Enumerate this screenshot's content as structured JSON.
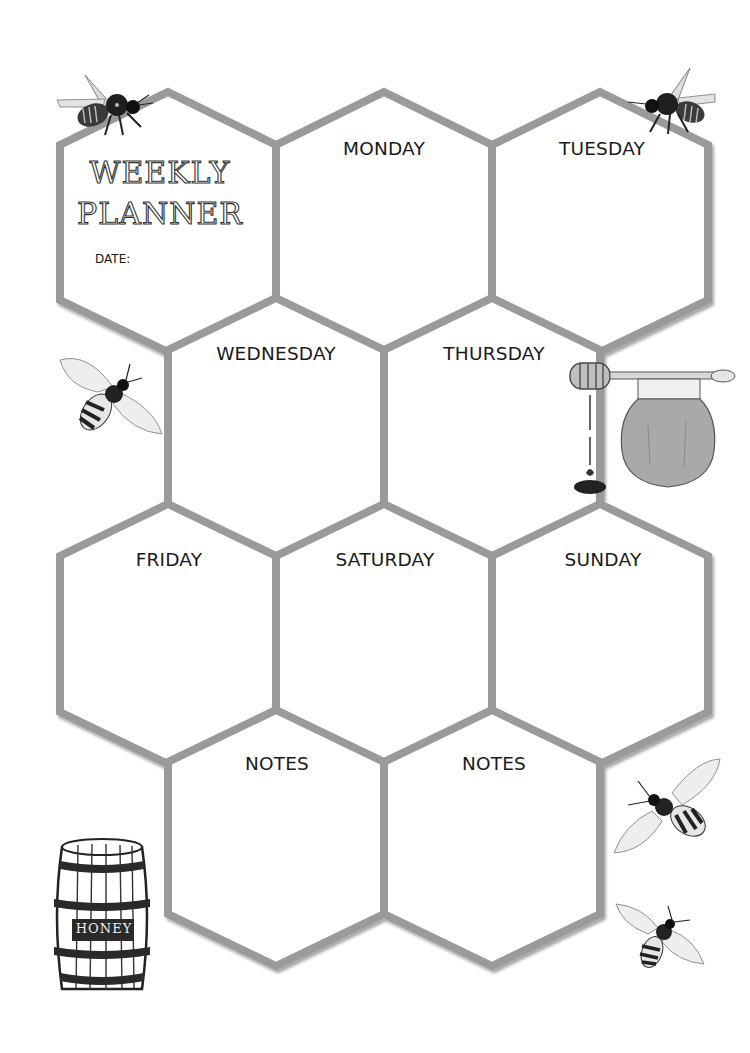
{
  "title": {
    "line1": "WEEKLY",
    "line2": "PLANNER"
  },
  "date_label": "DATE:",
  "cells": [
    {
      "id": "monday",
      "label": "MONDAY"
    },
    {
      "id": "tuesday",
      "label": "TUESDAY"
    },
    {
      "id": "wednesday",
      "label": "WEDNESDAY"
    },
    {
      "id": "thursday",
      "label": "THURSDAY"
    },
    {
      "id": "friday",
      "label": "FRIDAY"
    },
    {
      "id": "saturday",
      "label": "SATURDAY"
    },
    {
      "id": "sunday",
      "label": "SUNDAY"
    },
    {
      "id": "notes-1",
      "label": "NOTES"
    },
    {
      "id": "notes-2",
      "label": "NOTES"
    }
  ],
  "decorations": {
    "barrel_label": "HONEY"
  },
  "colors": {
    "hex_stroke": "#9a9a9a",
    "honey_jar": "#a9a9a9",
    "bee_body": "#222222"
  }
}
